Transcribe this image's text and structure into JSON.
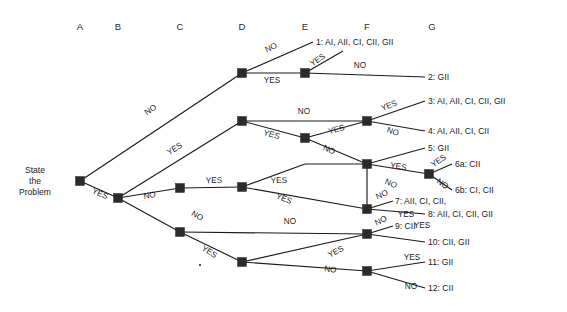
{
  "diagram": {
    "type": "decision-tree",
    "title_present": false,
    "root": {
      "lines": [
        "State",
        "the",
        "Problem"
      ],
      "x": 35,
      "y": 181
    },
    "columns": [
      {
        "id": "A",
        "label": "A",
        "x": 80,
        "y": 30
      },
      {
        "id": "B",
        "label": "B",
        "x": 118,
        "y": 30
      },
      {
        "id": "C",
        "label": "C",
        "x": 180,
        "y": 30
      },
      {
        "id": "D",
        "label": "D",
        "x": 242,
        "y": 30
      },
      {
        "id": "E",
        "label": "E",
        "x": 305,
        "y": 30
      },
      {
        "id": "F",
        "label": "F",
        "x": 367,
        "y": 30
      },
      {
        "id": "G",
        "label": "G",
        "x": 432,
        "y": 30
      }
    ],
    "nodes": [
      {
        "id": "A1",
        "column": "A",
        "x": 80,
        "y": 181
      },
      {
        "id": "B1",
        "column": "B",
        "x": 118,
        "y": 198
      },
      {
        "id": "C1",
        "column": "C",
        "x": 180,
        "y": 188
      },
      {
        "id": "C2",
        "column": "C",
        "x": 180,
        "y": 232
      },
      {
        "id": "D1",
        "column": "D",
        "x": 242,
        "y": 73
      },
      {
        "id": "D2",
        "column": "D",
        "x": 242,
        "y": 121
      },
      {
        "id": "D3",
        "column": "D",
        "x": 242,
        "y": 187
      },
      {
        "id": "D4",
        "column": "D",
        "x": 242,
        "y": 262
      },
      {
        "id": "E1",
        "column": "E",
        "x": 305,
        "y": 73
      },
      {
        "id": "E2",
        "column": "E",
        "x": 305,
        "y": 138
      },
      {
        "id": "E3",
        "column": "E",
        "x": 305,
        "y": 164
      },
      {
        "id": "F1",
        "column": "F",
        "x": 367,
        "y": 121
      },
      {
        "id": "F2",
        "column": "F",
        "x": 367,
        "y": 209
      },
      {
        "id": "F3",
        "column": "F",
        "x": 367,
        "y": 234
      },
      {
        "id": "F4",
        "column": "F",
        "x": 367,
        "y": 271
      },
      {
        "id": "G1",
        "column": "G",
        "x": 429,
        "y": 174
      }
    ],
    "edges": [
      {
        "from": "A1",
        "to": "D1",
        "label": "NO",
        "label_x": 152,
        "label_y": 117,
        "rotate": -25
      },
      {
        "from": "A1",
        "to": "B1",
        "label": "YES",
        "label_x": 100,
        "label_y": 196,
        "rotate": 22
      },
      {
        "from": "B1",
        "to": "D2",
        "label": "YES",
        "label_x": 176,
        "label_y": 152,
        "rotate": -29
      },
      {
        "from": "B1",
        "to": "C1",
        "label": "NO",
        "label_x": 150,
        "label_y": 200,
        "rotate": -8
      },
      {
        "from": "C1",
        "to": "D3",
        "label": "YES",
        "label_x": 213,
        "label_y": 184,
        "rotate": 0
      },
      {
        "from": "C1",
        "to": "C2",
        "label": "NO",
        "label_x": 192,
        "label_y": 215,
        "rotate": 32
      },
      {
        "from": "D1",
        "to": "f1_out",
        "label": "NO",
        "label_x": 272,
        "label_y": 51,
        "rotate": -32
      },
      {
        "from": "D1",
        "to": "E1",
        "label": "YES",
        "label_x": 272,
        "label_y": 83,
        "rotate": 0
      },
      {
        "from": "E1",
        "to": "f1_out2",
        "label": "YES",
        "label_x": 318,
        "label_y": 62,
        "rotate": -44
      },
      {
        "from": "E1",
        "to": "f2_out",
        "label": "NO",
        "label_x": 358,
        "label_y": 68,
        "rotate": 0
      },
      {
        "from": "D2",
        "to": "F1",
        "label": "NO",
        "label_x": 304,
        "label_y": 114,
        "rotate": 0
      },
      {
        "from": "D2",
        "to": "E2",
        "label": "YES",
        "label_x": 272,
        "label_y": 137,
        "rotate": 16
      },
      {
        "from": "F1",
        "to": "out3",
        "label": "YES",
        "label_x": 389,
        "label_y": 109,
        "rotate": -30
      },
      {
        "from": "F1",
        "to": "out4",
        "label": "NO",
        "label_x": 391,
        "label_y": 135,
        "rotate": 20
      },
      {
        "from": "E2",
        "to": "F1",
        "label": "YES",
        "label_x": 336,
        "label_y": 133,
        "rotate": -17
      },
      {
        "from": "E2",
        "to": "E3",
        "label": "NO",
        "label_x": 327,
        "label_y": 152,
        "rotate": 23
      },
      {
        "from": "E3",
        "to": "out5",
        "label": "",
        "label_x": 0,
        "label_y": 0,
        "rotate": 0
      },
      {
        "from": "E3",
        "to": "G1",
        "label": "YES",
        "label_x": 395,
        "label_y": 167,
        "rotate": 10
      },
      {
        "from": "E3",
        "to": "F3b",
        "label": "NO",
        "label_x": 390,
        "label_y": 185,
        "rotate": 22
      },
      {
        "from": "G1",
        "to": "out6a",
        "label": "YES",
        "label_x": 443,
        "label_y": 165,
        "rotate": -40
      },
      {
        "from": "G1",
        "to": "out6b",
        "label": "NO",
        "label_x": 444,
        "label_y": 185,
        "rotate": 36
      },
      {
        "from": "D3",
        "to": "E3",
        "label": "YES",
        "label_x": 277,
        "label_y": 184,
        "rotate": 0
      },
      {
        "from": "D3",
        "to": "F2",
        "label": "YES",
        "label_x": 282,
        "label_y": 200,
        "rotate": 22
      },
      {
        "from": "C2",
        "to": "F3",
        "label": "NO",
        "label_x": 288,
        "label_y": 224,
        "rotate": 0
      },
      {
        "from": "C2",
        "to": "D4",
        "label": "YES",
        "label_x": 208,
        "label_y": 253,
        "rotate": 35
      },
      {
        "from": "F2",
        "to": "out7",
        "label": "NO",
        "label_x": 385,
        "label_y": 198,
        "rotate": -27
      },
      {
        "from": "F2",
        "to": "out8",
        "label": "YES",
        "label_x": 405,
        "label_y": 216,
        "rotate": 0
      },
      {
        "from": "F3",
        "to": "out9",
        "label": "NO",
        "label_x": 384,
        "label_y": 224,
        "rotate": -27
      },
      {
        "from": "F3",
        "to": "out10",
        "label": "YES",
        "label_x": 420,
        "label_y": 228,
        "rotate": 0
      },
      {
        "from": "D4",
        "to": "F3",
        "label": "YES",
        "label_x": 336,
        "label_y": 255,
        "rotate": -30
      },
      {
        "from": "D4",
        "to": "F4",
        "label": "NO",
        "label_x": 330,
        "label_y": 270,
        "rotate": 8
      },
      {
        "from": "F4",
        "to": "out11",
        "label": "YES",
        "label_x": 413,
        "label_y": 262,
        "rotate": 0
      },
      {
        "from": "F4",
        "to": "out12",
        "label": "NO",
        "label_x": 412,
        "label_y": 287,
        "rotate": 0
      }
    ],
    "outcomes": [
      {
        "id": "1",
        "label": "1: AI, AII, CI, CII, GII",
        "x": 314,
        "y": 45,
        "leader_x1": 314,
        "leader_y1": 42
      },
      {
        "id": "2",
        "label": "2: GII",
        "x": 428,
        "y": 79
      },
      {
        "id": "3",
        "label": "3: AI, AII, CI, CII, GII",
        "x": 428,
        "y": 105
      },
      {
        "id": "4",
        "label": "4: AI, AII, CI, CII",
        "x": 428,
        "y": 134
      },
      {
        "id": "5",
        "label": "5: GII",
        "x": 428,
        "y": 151
      },
      {
        "id": "6a",
        "label": "6a: CII",
        "x": 453,
        "y": 167
      },
      {
        "id": "6b",
        "label": "6b: CI, CII",
        "x": 453,
        "y": 193
      },
      {
        "id": "7",
        "label": "7: AII, CI, CII,",
        "x": 394,
        "y": 205
      },
      {
        "id": "8",
        "label": "8: AII, CI, CII, GII",
        "x": 428,
        "y": 217
      },
      {
        "id": "9",
        "label": "9: CII",
        "x": 394,
        "y": 230
      },
      {
        "id": "10",
        "label": "10: CII, GII",
        "x": 428,
        "y": 245
      },
      {
        "id": "11",
        "label": "11: GII",
        "x": 428,
        "y": 265
      },
      {
        "id": "12",
        "label": "12: CII",
        "x": 428,
        "y": 291
      }
    ],
    "colors": {
      "line": "#1a1a1a",
      "node": "#2b2b2b",
      "text": "#1a1a1a",
      "background": "#ffffff"
    }
  }
}
